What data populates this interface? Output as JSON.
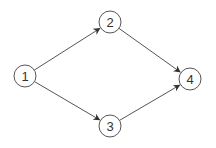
{
  "diagram": {
    "type": "directed-graph",
    "colors": {
      "stroke": "#555555",
      "node_fill": "#ffffff",
      "text": "#333333",
      "background": "#ffffff"
    },
    "nodes": [
      {
        "id": "1",
        "label": "1",
        "x": 25,
        "y": 76,
        "r": 11
      },
      {
        "id": "2",
        "label": "2",
        "x": 110,
        "y": 22,
        "r": 11
      },
      {
        "id": "3",
        "label": "3",
        "x": 110,
        "y": 126,
        "r": 11
      },
      {
        "id": "4",
        "label": "4",
        "x": 190,
        "y": 79,
        "r": 11
      }
    ],
    "edges": [
      {
        "from": "1",
        "to": "2"
      },
      {
        "from": "1",
        "to": "3"
      },
      {
        "from": "2",
        "to": "4"
      },
      {
        "from": "3",
        "to": "4"
      }
    ]
  }
}
